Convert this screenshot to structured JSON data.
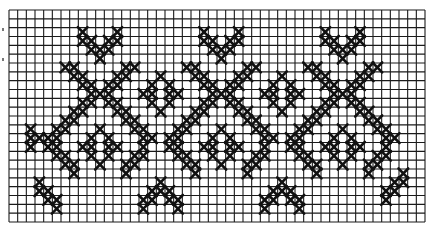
{
  "pattern": {
    "title": "Cross-stitch border pattern chart",
    "grid": {
      "columns": 48,
      "rows": 24,
      "origin_x": 9,
      "origin_y": 10,
      "width": 416,
      "height": 212,
      "line_color": "#1a1a1a",
      "stitch_color": "#111111",
      "background": "#ffffff"
    },
    "repeat": {
      "period_columns": 14,
      "motif_centers": [
        10,
        24,
        38
      ]
    },
    "motifs": [
      "top V motif",
      "diagonal lattice with X crossings",
      "small diamond rings",
      "bottom inverted-V motif"
    ],
    "stitches": [
      [
        2,
        8
      ],
      [
        2,
        12
      ],
      [
        3,
        8
      ],
      [
        3,
        9
      ],
      [
        3,
        11
      ],
      [
        3,
        12
      ],
      [
        4,
        9
      ],
      [
        4,
        10
      ],
      [
        4,
        11
      ],
      [
        5,
        10
      ],
      [
        2,
        22
      ],
      [
        2,
        26
      ],
      [
        3,
        22
      ],
      [
        3,
        23
      ],
      [
        3,
        25
      ],
      [
        3,
        26
      ],
      [
        4,
        23
      ],
      [
        4,
        24
      ],
      [
        4,
        25
      ],
      [
        5,
        24
      ],
      [
        2,
        36
      ],
      [
        2,
        40
      ],
      [
        3,
        36
      ],
      [
        3,
        37
      ],
      [
        3,
        39
      ],
      [
        3,
        40
      ],
      [
        4,
        37
      ],
      [
        4,
        38
      ],
      [
        4,
        39
      ],
      [
        5,
        38
      ],
      [
        6,
        6
      ],
      [
        6,
        7
      ],
      [
        7,
        7
      ],
      [
        7,
        8
      ],
      [
        8,
        8
      ],
      [
        8,
        9
      ],
      [
        9,
        9
      ],
      [
        9,
        10
      ],
      [
        9,
        11
      ],
      [
        8,
        11
      ],
      [
        8,
        12
      ],
      [
        7,
        12
      ],
      [
        7,
        13
      ],
      [
        6,
        13
      ],
      [
        6,
        14
      ],
      [
        6,
        20
      ],
      [
        6,
        21
      ],
      [
        7,
        21
      ],
      [
        7,
        22
      ],
      [
        8,
        22
      ],
      [
        8,
        23
      ],
      [
        9,
        23
      ],
      [
        9,
        24
      ],
      [
        9,
        25
      ],
      [
        8,
        25
      ],
      [
        8,
        26
      ],
      [
        7,
        26
      ],
      [
        7,
        27
      ],
      [
        6,
        27
      ],
      [
        6,
        28
      ],
      [
        6,
        34
      ],
      [
        6,
        35
      ],
      [
        7,
        35
      ],
      [
        7,
        36
      ],
      [
        8,
        36
      ],
      [
        8,
        37
      ],
      [
        9,
        37
      ],
      [
        9,
        38
      ],
      [
        9,
        39
      ],
      [
        8,
        39
      ],
      [
        8,
        40
      ],
      [
        7,
        40
      ],
      [
        7,
        41
      ],
      [
        6,
        41
      ],
      [
        6,
        42
      ],
      [
        10,
        8
      ],
      [
        10,
        9
      ],
      [
        11,
        7
      ],
      [
        11,
        8
      ],
      [
        12,
        6
      ],
      [
        12,
        7
      ],
      [
        13,
        5
      ],
      [
        13,
        6
      ],
      [
        14,
        4
      ],
      [
        14,
        5
      ],
      [
        15,
        4
      ],
      [
        15,
        5
      ],
      [
        16,
        5
      ],
      [
        16,
        6
      ],
      [
        17,
        6
      ],
      [
        17,
        7
      ],
      [
        18,
        7
      ],
      [
        10,
        11
      ],
      [
        10,
        12
      ],
      [
        11,
        12
      ],
      [
        11,
        13
      ],
      [
        12,
        13
      ],
      [
        12,
        14
      ],
      [
        13,
        14
      ],
      [
        13,
        15
      ],
      [
        14,
        15
      ],
      [
        14,
        16
      ],
      [
        15,
        15
      ],
      [
        16,
        14
      ],
      [
        16,
        15
      ],
      [
        17,
        13
      ],
      [
        17,
        14
      ],
      [
        18,
        13
      ],
      [
        10,
        22
      ],
      [
        10,
        23
      ],
      [
        11,
        21
      ],
      [
        11,
        22
      ],
      [
        12,
        20
      ],
      [
        12,
        21
      ],
      [
        13,
        19
      ],
      [
        13,
        20
      ],
      [
        14,
        18
      ],
      [
        14,
        19
      ],
      [
        15,
        18
      ],
      [
        15,
        19
      ],
      [
        16,
        19
      ],
      [
        16,
        20
      ],
      [
        17,
        20
      ],
      [
        17,
        21
      ],
      [
        18,
        21
      ],
      [
        10,
        25
      ],
      [
        10,
        26
      ],
      [
        11,
        26
      ],
      [
        11,
        27
      ],
      [
        12,
        27
      ],
      [
        12,
        28
      ],
      [
        13,
        28
      ],
      [
        13,
        29
      ],
      [
        14,
        29
      ],
      [
        14,
        30
      ],
      [
        15,
        29
      ],
      [
        16,
        28
      ],
      [
        16,
        29
      ],
      [
        17,
        27
      ],
      [
        17,
        28
      ],
      [
        18,
        27
      ],
      [
        10,
        36
      ],
      [
        10,
        37
      ],
      [
        11,
        35
      ],
      [
        11,
        36
      ],
      [
        12,
        34
      ],
      [
        12,
        35
      ],
      [
        13,
        33
      ],
      [
        13,
        34
      ],
      [
        14,
        32
      ],
      [
        14,
        33
      ],
      [
        15,
        32
      ],
      [
        15,
        33
      ],
      [
        16,
        33
      ],
      [
        16,
        34
      ],
      [
        17,
        34
      ],
      [
        17,
        35
      ],
      [
        18,
        35
      ],
      [
        10,
        39
      ],
      [
        10,
        40
      ],
      [
        11,
        40
      ],
      [
        11,
        41
      ],
      [
        12,
        41
      ],
      [
        12,
        42
      ],
      [
        13,
        42
      ],
      [
        13,
        43
      ],
      [
        14,
        43
      ],
      [
        14,
        44
      ],
      [
        15,
        43
      ],
      [
        16,
        42
      ],
      [
        16,
        43
      ],
      [
        17,
        41
      ],
      [
        17,
        42
      ],
      [
        18,
        41
      ],
      [
        13,
        10
      ],
      [
        14,
        9
      ],
      [
        14,
        11
      ],
      [
        15,
        8
      ],
      [
        15,
        9
      ],
      [
        15,
        11
      ],
      [
        15,
        12
      ],
      [
        16,
        9
      ],
      [
        16,
        11
      ],
      [
        17,
        10
      ],
      [
        13,
        24
      ],
      [
        14,
        23
      ],
      [
        14,
        25
      ],
      [
        15,
        22
      ],
      [
        15,
        23
      ],
      [
        15,
        25
      ],
      [
        15,
        26
      ],
      [
        16,
        23
      ],
      [
        16,
        25
      ],
      [
        17,
        24
      ],
      [
        13,
        38
      ],
      [
        14,
        37
      ],
      [
        14,
        39
      ],
      [
        15,
        36
      ],
      [
        15,
        37
      ],
      [
        15,
        39
      ],
      [
        15,
        40
      ],
      [
        16,
        37
      ],
      [
        16,
        39
      ],
      [
        17,
        38
      ],
      [
        7,
        17
      ],
      [
        8,
        16
      ],
      [
        8,
        18
      ],
      [
        9,
        15
      ],
      [
        9,
        16
      ],
      [
        9,
        18
      ],
      [
        9,
        19
      ],
      [
        10,
        16
      ],
      [
        10,
        18
      ],
      [
        11,
        17
      ],
      [
        7,
        31
      ],
      [
        8,
        30
      ],
      [
        8,
        32
      ],
      [
        9,
        29
      ],
      [
        9,
        30
      ],
      [
        9,
        32
      ],
      [
        9,
        33
      ],
      [
        10,
        30
      ],
      [
        10,
        32
      ],
      [
        11,
        31
      ],
      [
        13,
        2
      ],
      [
        14,
        2
      ],
      [
        14,
        3
      ],
      [
        15,
        2
      ],
      [
        19,
        3
      ],
      [
        20,
        3
      ],
      [
        20,
        4
      ],
      [
        21,
        4
      ],
      [
        21,
        5
      ],
      [
        22,
        5
      ],
      [
        19,
        17
      ],
      [
        20,
        16
      ],
      [
        20,
        17
      ],
      [
        20,
        18
      ],
      [
        21,
        15
      ],
      [
        21,
        16
      ],
      [
        21,
        18
      ],
      [
        21,
        19
      ],
      [
        22,
        15
      ],
      [
        22,
        19
      ],
      [
        19,
        31
      ],
      [
        20,
        30
      ],
      [
        20,
        31
      ],
      [
        20,
        32
      ],
      [
        21,
        29
      ],
      [
        21,
        30
      ],
      [
        21,
        32
      ],
      [
        21,
        33
      ],
      [
        22,
        29
      ],
      [
        22,
        33
      ],
      [
        18,
        45
      ],
      [
        19,
        44
      ],
      [
        19,
        45
      ],
      [
        20,
        43
      ],
      [
        20,
        44
      ],
      [
        21,
        43
      ]
    ]
  }
}
